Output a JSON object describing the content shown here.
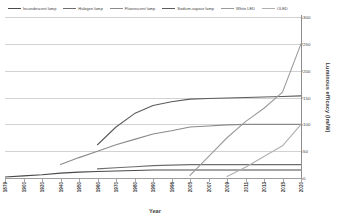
{
  "chart_data": {
    "type": "line",
    "title": "",
    "xlabel": "Year",
    "ylabel": "Luminous efficacy (lm/W)",
    "ylim": [
      0,
      300
    ],
    "yticks": [
      0,
      50,
      100,
      150,
      200,
      250,
      300
    ],
    "grid": true,
    "legend_position": "top",
    "categories": [
      "1879",
      "1900",
      "1920",
      "1940",
      "1950",
      "1960",
      "1970",
      "1980",
      "1990",
      "1996",
      "2005",
      "2007",
      "2009",
      "2011",
      "2013",
      "2015",
      "2020"
    ],
    "series": [
      {
        "name": "Incandescent lamp",
        "color": "#4a4a4a",
        "values": [
          2,
          4,
          6,
          9,
          11,
          12,
          13,
          14,
          15,
          15,
          15,
          15,
          15,
          15,
          15,
          15,
          15
        ]
      },
      {
        "name": "Halogen lamp",
        "color": "#6e6e6e",
        "values": [
          null,
          null,
          null,
          null,
          null,
          17,
          19,
          21,
          23,
          24,
          25,
          25,
          25,
          25,
          25,
          25,
          25
        ]
      },
      {
        "name": "Fluorescent lamp",
        "color": "#8a8a8a",
        "values": [
          null,
          null,
          null,
          25,
          38,
          50,
          62,
          72,
          82,
          88,
          95,
          97,
          99,
          100,
          100,
          100,
          100
        ]
      },
      {
        "name": "Sodium-vapour lamp",
        "color": "#5c5c5c",
        "values": [
          null,
          null,
          null,
          null,
          null,
          62,
          95,
          120,
          135,
          142,
          147,
          148,
          149,
          150,
          151,
          152,
          153
        ]
      },
      {
        "name": "White LED",
        "color": "#9a9a9a",
        "values": [
          null,
          null,
          null,
          null,
          null,
          null,
          null,
          null,
          null,
          null,
          5,
          40,
          75,
          105,
          130,
          160,
          250
        ]
      },
      {
        "name": "OLED",
        "color": "#b0b0b0",
        "values": [
          null,
          null,
          null,
          null,
          null,
          null,
          null,
          null,
          null,
          null,
          null,
          null,
          3,
          20,
          40,
          60,
          100
        ]
      }
    ]
  }
}
